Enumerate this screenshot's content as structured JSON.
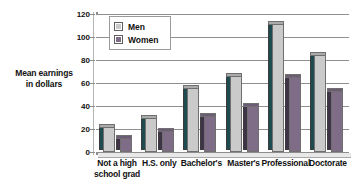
{
  "chart_data": {
    "type": "bar",
    "title": "",
    "subtitle": "",
    "xlabel": "",
    "ylabel": "Mean earnings in dollars",
    "ylabel_line1": "Mean earnings",
    "ylabel_line2": "in dollars",
    "ylim": [
      0,
      120
    ],
    "ytick_step": 20,
    "yticks": [
      0,
      20,
      40,
      60,
      80,
      100,
      120
    ],
    "ytick_labels": [
      "0",
      "20",
      "40",
      "60",
      "80",
      "100",
      "120"
    ],
    "grid": true,
    "grid_axis": "y",
    "legend_position": "upper left",
    "style": "3d-bar",
    "categories": [
      "Not a high school grad",
      "H.S. only",
      "Bachelor's",
      "Master's",
      "Professional",
      "Doctorate"
    ],
    "category_lines": [
      [
        "Not a high",
        "school grad"
      ],
      [
        "H.S. only"
      ],
      [
        "Bachelor's"
      ],
      [
        "Master's"
      ],
      [
        "Professional"
      ],
      [
        "Doctorate"
      ]
    ],
    "series": [
      {
        "name": "Men",
        "color": "#c9cac9",
        "side_color": "#1d4b4f",
        "values": [
          22,
          30,
          56,
          66,
          111,
          84
        ]
      },
      {
        "name": "Women",
        "color": "#7f6c86",
        "side_color": "#3f3347",
        "values": [
          12,
          18,
          31,
          40,
          65,
          53
        ]
      }
    ]
  },
  "legend": {
    "items": [
      {
        "label": "Men",
        "swatch": "legend-swatch-men"
      },
      {
        "label": "Women",
        "swatch": "legend-swatch-women"
      }
    ]
  },
  "colors": {
    "men_front": "#c9cac9",
    "men_side": "#1d4b4f",
    "women_front": "#7f6c86",
    "women_side": "#3f3347",
    "gridline": "#8f8f8f",
    "axis": "#8d8d8d",
    "background": "#ffffff",
    "text": "#111111"
  }
}
